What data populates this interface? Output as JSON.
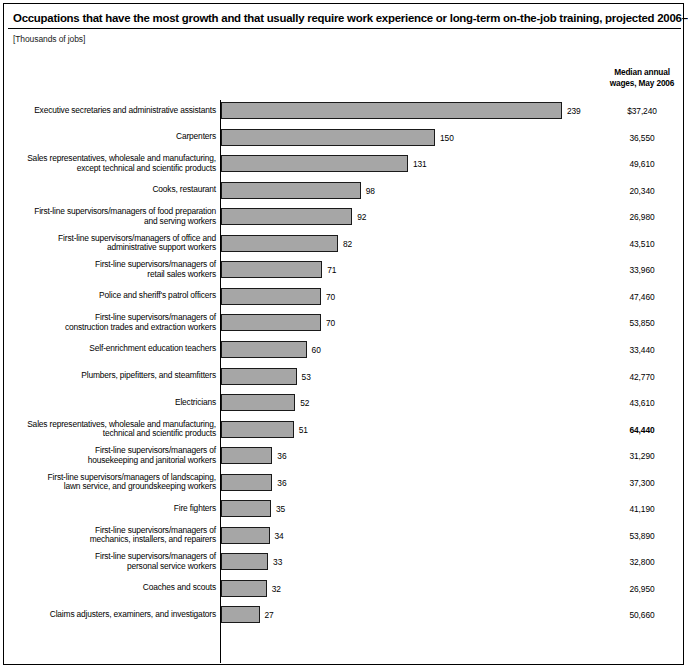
{
  "header": {
    "title": "Occupations that have the most growth and that usually require work experience or long-term on-the-job training, projected 2006–16",
    "subtitle": "[Thousands of jobs]",
    "wage_column_header": "Median annual\nwages, May 2006",
    "wage_column_header_line1": "Median annual",
    "wage_column_header_line2": "wages, May 2006"
  },
  "chart_data": {
    "type": "bar",
    "orientation": "horizontal",
    "title": "Occupations that have the most growth and that usually require work experience or long-term on-the-job training, projected 2006–16",
    "subtitle": "[Thousands of jobs]",
    "xlabel": "",
    "ylabel": "",
    "units": "Thousands of jobs",
    "grid": false,
    "legend": "none",
    "xlim": [
      0,
      250
    ],
    "categories": [
      "Executive secretaries and administrative assistants",
      "Carpenters",
      "Sales representatives, wholesale and manufacturing, except technical and scientific products",
      "Cooks, restaurant",
      "First-line supervisors/managers of food preparation and serving workers",
      "First-line supervisors/managers of office and administrative support workers",
      "First-line supervisors/managers of retail sales workers",
      "Police and sheriff's patrol officers",
      "First-line supervisors/managers of construction trades and extraction workers",
      "Self-enrichment education teachers",
      "Plumbers, pipefitters, and steamfitters",
      "Electricians",
      "Sales representatives, wholesale and manufacturing, technical and scientific products",
      "First-line supervisors/managers of housekeeping and janitorial workers",
      "First-line supervisors/managers of landscaping, lawn service, and groundskeeping workers",
      "Fire fighters",
      "First-line supervisors/managers of mechanics, installers, and repairers",
      "First-line supervisors/managers of personal service workers",
      "Coaches and scouts",
      "Claims adjusters, examiners, and investigators"
    ],
    "values": [
      239,
      150,
      131,
      98,
      92,
      82,
      71,
      70,
      70,
      60,
      53,
      52,
      51,
      36,
      36,
      35,
      34,
      33,
      32,
      27
    ],
    "series": [
      {
        "name": "Projected job growth, 2006–16 (thousands)",
        "values": [
          239,
          150,
          131,
          98,
          92,
          82,
          71,
          70,
          70,
          60,
          53,
          52,
          51,
          36,
          36,
          35,
          34,
          33,
          32,
          27
        ]
      }
    ],
    "annotations": {
      "wages_label": "Median annual wages, May 2006",
      "wages": [
        "$37,240",
        "36,550",
        "49,610",
        "20,340",
        "26,980",
        "43,510",
        "33,960",
        "47,460",
        "53,850",
        "33,440",
        "42,770",
        "43,610",
        "64,440",
        "31,290",
        "37,300",
        "41,190",
        "53,890",
        "32,800",
        "26,950",
        "50,660"
      ]
    }
  },
  "rows": [
    {
      "label_lines": [
        "Executive secretaries and administrative assistants"
      ],
      "value": "239",
      "wage": "$37,240",
      "wage_bold": false
    },
    {
      "label_lines": [
        "Carpenters"
      ],
      "value": "150",
      "wage": "36,550",
      "wage_bold": false
    },
    {
      "label_lines": [
        "Sales representatives, wholesale and manufacturing,",
        "except technical and scientific products"
      ],
      "value": "131",
      "wage": "49,610",
      "wage_bold": false
    },
    {
      "label_lines": [
        "Cooks, restaurant"
      ],
      "value": "98",
      "wage": "20,340",
      "wage_bold": false
    },
    {
      "label_lines": [
        "First-line supervisors/managers of food preparation",
        "and serving workers"
      ],
      "value": "92",
      "wage": "26,980",
      "wage_bold": false
    },
    {
      "label_lines": [
        "First-line supervisors/managers of office and",
        "administrative support workers"
      ],
      "value": "82",
      "wage": "43,510",
      "wage_bold": false
    },
    {
      "label_lines": [
        "First-line supervisors/managers of",
        "retail sales workers"
      ],
      "value": "71",
      "wage": "33,960",
      "wage_bold": false
    },
    {
      "label_lines": [
        "Police and sheriff's patrol officers"
      ],
      "value": "70",
      "wage": "47,460",
      "wage_bold": false
    },
    {
      "label_lines": [
        "First-line supervisors/managers of",
        "construction trades and extraction workers"
      ],
      "value": "70",
      "wage": "53,850",
      "wage_bold": false
    },
    {
      "label_lines": [
        "Self-enrichment education teachers"
      ],
      "value": "60",
      "wage": "33,440",
      "wage_bold": false
    },
    {
      "label_lines": [
        "Plumbers, pipefitters, and steamfitters"
      ],
      "value": "53",
      "wage": "42,770",
      "wage_bold": false
    },
    {
      "label_lines": [
        "Electricians"
      ],
      "value": "52",
      "wage": "43,610",
      "wage_bold": false
    },
    {
      "label_lines": [
        "Sales representatives, wholesale and manufacturing,",
        "technical and scientific products"
      ],
      "value": "51",
      "wage": "64,440",
      "wage_bold": true
    },
    {
      "label_lines": [
        "First-line supervisors/managers of",
        "housekeeping and janitorial workers"
      ],
      "value": "36",
      "wage": "31,290",
      "wage_bold": false
    },
    {
      "label_lines": [
        "First-line supervisors/managers of landscaping,",
        "lawn service, and groundskeeping workers"
      ],
      "value": "36",
      "wage": "37,300",
      "wage_bold": false
    },
    {
      "label_lines": [
        "Fire fighters"
      ],
      "value": "35",
      "wage": "41,190",
      "wage_bold": false
    },
    {
      "label_lines": [
        "First-line supervisors/managers of",
        "mechanics, installers, and repairers"
      ],
      "value": "34",
      "wage": "53,890",
      "wage_bold": false
    },
    {
      "label_lines": [
        "First-line supervisors/managers of",
        "personal service workers"
      ],
      "value": "33",
      "wage": "32,800",
      "wage_bold": false
    },
    {
      "label_lines": [
        "Coaches and scouts"
      ],
      "value": "32",
      "wage": "26,950",
      "wage_bold": false
    },
    {
      "label_lines": [
        "Claims adjusters, examiners, and investigators"
      ],
      "value": "27",
      "wage": "50,660",
      "wage_bold": false
    }
  ],
  "style": {
    "bar_fill": "#a6a6a6",
    "bar_stroke": "#1a1a1a",
    "text_color": "#000000",
    "background": "#ffffff"
  },
  "geometry": {
    "axis_x": 216,
    "first_row_top": 98,
    "row_pitch": 26.55,
    "bar_height": 17,
    "px_per_unit": 1.4268
  }
}
